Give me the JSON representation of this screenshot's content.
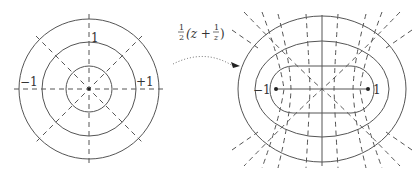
{
  "left_diagram": {
    "labels": {
      "top": "1",
      "left": "−1",
      "right": "+1"
    },
    "center": [
      89,
      89
    ],
    "circle_radii": [
      23,
      47,
      70
    ]
  },
  "arrow": {
    "label_prefix": "1/2",
    "label": "½(z + ¹⁄z)",
    "frac_num": "1",
    "frac_den": "2",
    "paren_open": "(z +",
    "inner_num": "1",
    "inner_den": "z",
    "paren_close": ")"
  },
  "right_diagram": {
    "labels": {
      "left": "−1",
      "right": "1"
    },
    "center": [
      322,
      89
    ],
    "ellipses": [
      [
        84,
        73
      ],
      [
        66,
        48
      ]
    ],
    "segment": [
      276,
      368
    ]
  },
  "colors": {
    "stroke": "#555555",
    "text": "#333333"
  }
}
